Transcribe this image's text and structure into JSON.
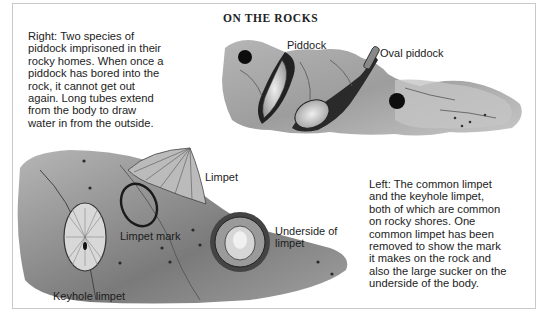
{
  "page": {
    "title": "ON THE ROCKS",
    "captions": {
      "right": "Right: Two species of\npiddock imprisoned in their\nrocky homes. When once a\npiddock has bored into the\nrock, it cannot get out\nagain. Long tubes extend\nfrom the body to draw\nwater in from the outside.",
      "left": "Left: The common limpet\nand the keyhole limpet,\nboth of which are common\non rocky shores. One\ncommon limpet has been\nremoved to show the mark\nit makes on the rock and\nalso the large sucker on the\nunderside of the body."
    },
    "labels": {
      "piddock": "Piddock",
      "oval_piddock": "Oval piddock",
      "limpet": "Limpet",
      "limpet_mark": "Limpet mark",
      "underside": "Underside of\nlimpet",
      "keyhole_limpet": "Keyhole limpet"
    },
    "illustrations": [
      "piddock-rock-illustration",
      "limpet-rock-illustration"
    ]
  }
}
